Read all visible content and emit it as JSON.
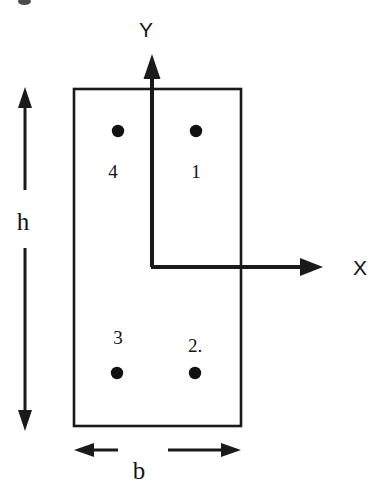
{
  "figure": {
    "type": "engineering-cross-section-diagram",
    "line_color": "#1a1a1a",
    "fill_color": "#ffffff",
    "background": "#ffffff"
  },
  "axes": {
    "x": {
      "label": "X",
      "label_pos": [
        360,
        267
      ],
      "origin": [
        152,
        267
      ],
      "tip": [
        322,
        267
      ],
      "direction": "right"
    },
    "y": {
      "label": "Y",
      "label_pos": [
        146,
        29
      ],
      "origin": [
        152,
        267
      ],
      "tip": [
        152,
        56
      ],
      "direction": "up"
    }
  },
  "section": {
    "left": 74,
    "top": 89,
    "right": 241,
    "bottom": 426,
    "width_label": "b",
    "height_label": "h"
  },
  "dimensions": {
    "height": {
      "label": "h",
      "label_pos": [
        23,
        221
      ],
      "line_x": 25,
      "top_tip": 88,
      "bottom_tip": 430
    },
    "width": {
      "label": "b",
      "label_pos": [
        139,
        470
      ],
      "line_y": 450,
      "left_tip": 74,
      "right_tip": 241
    }
  },
  "bars": [
    {
      "id": "1",
      "label": "1",
      "dot": [
        196,
        131
      ],
      "label_pos": [
        196,
        171
      ],
      "quadrant": "top-right"
    },
    {
      "id": "2",
      "label": "2.",
      "dot": [
        195,
        373
      ],
      "label_pos": [
        195,
        345
      ],
      "quadrant": "bottom-right"
    },
    {
      "id": "3",
      "label": "3",
      "dot": [
        117,
        373
      ],
      "label_pos": [
        118,
        337
      ],
      "quadrant": "bottom-left"
    },
    {
      "id": "4",
      "label": "4",
      "dot": [
        118,
        131
      ],
      "label_pos": [
        113,
        171
      ],
      "quadrant": "top-left"
    }
  ],
  "artifacts": {
    "top_left_smudge": {
      "x": 18,
      "y": 0,
      "w": 13,
      "h": 6
    }
  }
}
